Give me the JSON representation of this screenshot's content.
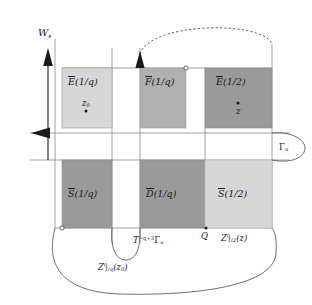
{
  "figure": {
    "axis": {
      "vertical_label_base": "W",
      "vertical_label_sub": "s",
      "vertical_arrow": "up-arrow",
      "horizontal_arrow": "left-arrow"
    },
    "colors": {
      "light_gray": "#d6d6d6",
      "mid_gray": "#b0b0b0",
      "dark_gray": "#9a9a9a",
      "stroke": "#1a1a1a",
      "thin_line": "#777777",
      "background": "#ffffff"
    },
    "rectangles": [
      {
        "id": "E-1-q",
        "base": "E",
        "arg": "(1/q)",
        "shade": "#d6d6d6",
        "row": "top",
        "col": 1
      },
      {
        "id": "F-1-q",
        "base": "F",
        "arg": "(1/q)",
        "shade": "#b0b0b0",
        "row": "top",
        "col": 2
      },
      {
        "id": "E-1-2",
        "base": "E",
        "arg": "(1/2)",
        "shade": "#9a9a9a",
        "row": "top",
        "col": 3
      },
      {
        "id": "S-1-q",
        "base": "S",
        "arg": "(1/q)",
        "shade": "#9a9a9a",
        "row": "bottom",
        "col": 1
      },
      {
        "id": "D-1-q",
        "base": "D",
        "arg": "(1/q)",
        "shade": "#9a9a9a",
        "row": "bottom",
        "col": 2
      },
      {
        "id": "S-1-2",
        "base": "S",
        "arg": "(1/2)",
        "shade": "#d6d6d6",
        "row": "bottom",
        "col": 3
      }
    ],
    "points": [
      {
        "id": "z0",
        "base": "z",
        "sub": "0",
        "x": 86,
        "y": 103
      },
      {
        "id": "z",
        "base": "z",
        "sub": "",
        "x": 238,
        "y": 103
      },
      {
        "id": "Q",
        "base": "Q",
        "sub": "",
        "x": 206,
        "y": 228
      }
    ],
    "curve_labels": {
      "gamma_u": {
        "base": "Γ",
        "sub": "u"
      },
      "T_gamma_u": {
        "pre": "T",
        "sup": "−q+3",
        "base": "Γ",
        "sub": "u"
      },
      "Z_1q_z0": {
        "base": "Z",
        "sup": "0",
        "sub": "1/q",
        "arg": "(z",
        "argsub": "0",
        "argend": ")"
      },
      "Z_12_z": {
        "base": "Z",
        "sup": "0",
        "sub": "1/2",
        "arg": "(z",
        "argsub": "",
        "argend": ")"
      }
    },
    "markers": [
      {
        "id": "open-circle-top-right",
        "x": 186,
        "y": 68
      },
      {
        "id": "open-circle-bottom-left",
        "x": 62,
        "y": 228
      }
    ]
  }
}
